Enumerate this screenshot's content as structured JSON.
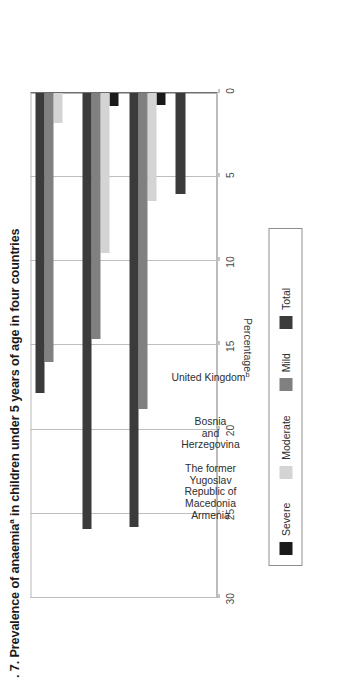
{
  "figure": {
    "title_prefix": ". 7. Prevalence of anaemia",
    "title_superscript": "a",
    "title_suffix": " in children under 5 years of age in four countries"
  },
  "axis": {
    "value_axis_title": "Percentage",
    "ticks": [
      "30",
      "25",
      "20",
      "15",
      "10",
      "5",
      "0"
    ]
  },
  "legend": {
    "items": [
      {
        "label": "Severe",
        "key": "severe",
        "color": "#1a1a1a"
      },
      {
        "label": "Moderate",
        "key": "moderate",
        "color": "#d4d4d4"
      },
      {
        "label": "Mild",
        "key": "mild",
        "color": "#808080"
      },
      {
        "label": "Total",
        "key": "total",
        "color": "#3b3b3b"
      }
    ]
  },
  "categories": [
    {
      "label": "Armenia",
      "superscript": ""
    },
    {
      "label": "The former\nYugoslav\nRepublic of\nMacedonia",
      "superscript": ""
    },
    {
      "label": "Bosnia\nand\nHerzegovina",
      "superscript": ""
    },
    {
      "label": "United Kingdom",
      "superscript": "b"
    }
  ],
  "chart_data": {
    "type": "bar",
    "orientation": "vertical-rendered-rotated",
    "xlabel": "",
    "ylabel": "Percentage",
    "ylim": [
      0,
      30
    ],
    "ytick_values": [
      0,
      5,
      10,
      15,
      20,
      25,
      30
    ],
    "grid": true,
    "legend_position": "bottom",
    "categories": [
      "Armenia",
      "The former Yugoslav Republic of Macedonia",
      "Bosnia and Herzegovina",
      "United Kingdom"
    ],
    "series": [
      {
        "name": "Severe",
        "color": "#1a1a1a",
        "values": [
          0.0,
          0.8,
          0.7,
          0.0
        ]
      },
      {
        "name": "Moderate",
        "color": "#d4d4d4",
        "values": [
          1.8,
          9.5,
          6.4,
          0.0
        ]
      },
      {
        "name": "Mild",
        "color": "#808080",
        "values": [
          16.0,
          14.6,
          18.8,
          0.0
        ]
      },
      {
        "name": "Total",
        "color": "#3b3b3b",
        "values": [
          17.8,
          25.9,
          25.8,
          6.0
        ]
      }
    ]
  }
}
